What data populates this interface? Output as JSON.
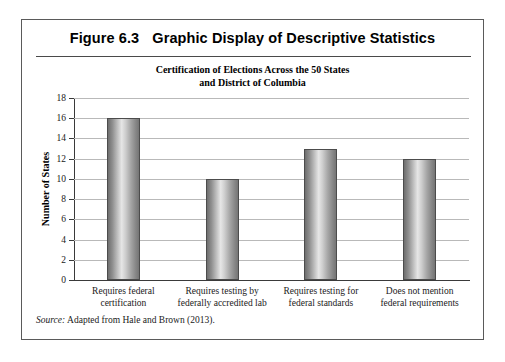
{
  "figure": {
    "number_label": "Figure 6.3",
    "heading": "Graphic Display of Descriptive Statistics",
    "source_word": "Source:",
    "source_text": "Adapted from Hale and Brown (2013)."
  },
  "chart_data": {
    "type": "bar",
    "title": "Certification of Elections Across the 50 States and District of Columbia",
    "title_line1": "Certification of Elections Across the 50 States",
    "title_line2": "and District of Columbia",
    "xlabel": "",
    "ylabel": "Number of States",
    "categories": [
      "Requires federal certification",
      "Requires testing by federally accredited lab",
      "Requires testing for federal standards",
      "Does not mention federal requirements"
    ],
    "category_lines": [
      [
        "Requires federal",
        "certification"
      ],
      [
        "Requires testing by",
        "federally accredited lab"
      ],
      [
        "Requires testing for",
        "federal standards"
      ],
      [
        "Does not mention",
        "federal requirements"
      ]
    ],
    "values": [
      16,
      10,
      13,
      12
    ],
    "ylim": [
      0,
      18
    ],
    "ytick_values": [
      0,
      2,
      4,
      6,
      8,
      10,
      12,
      14,
      16,
      18
    ],
    "ytick_labels": [
      "0",
      "2",
      "4",
      "6",
      "8",
      "10",
      "12",
      "14",
      "16",
      "18"
    ],
    "grid": true,
    "legend": false,
    "bar_color_light": "#e6e6e6",
    "bar_color_dark": "#6e6e6e",
    "bar_outline_color": "#4c4c4c",
    "gridline_color": "#b9b9b9",
    "axis_color": "#3a3a3a"
  }
}
